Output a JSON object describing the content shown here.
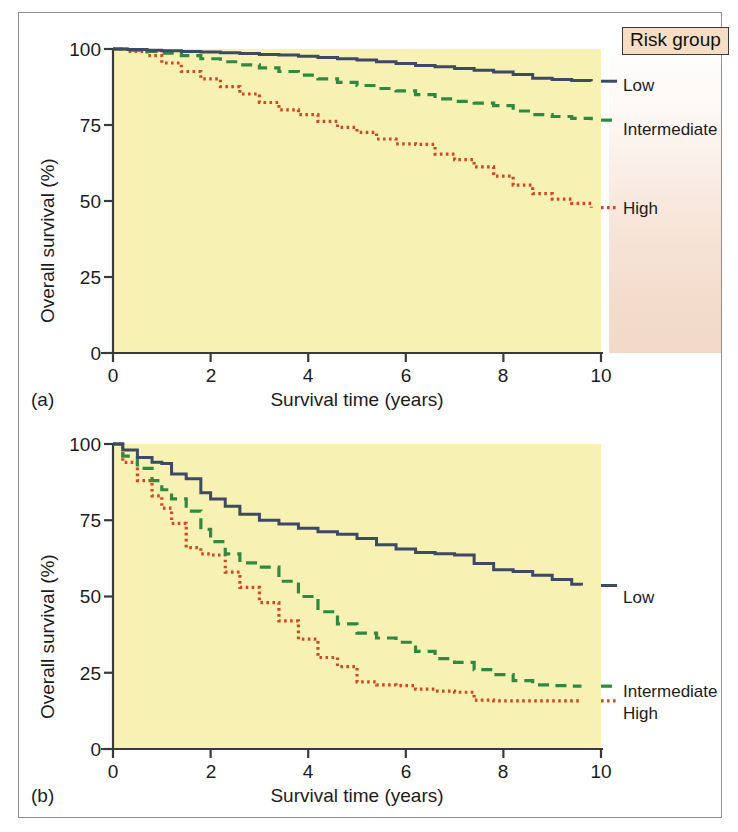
{
  "figure": {
    "panels": [
      {
        "tag": "(a)",
        "axis": {
          "xlabel": "Survival time (years)",
          "ylabel": "Overall survival (%)",
          "xticks": [
            "0",
            "2",
            "4",
            "6",
            "8",
            "10"
          ],
          "yticks": [
            "0",
            "25",
            "50",
            "75",
            "100"
          ]
        }
      },
      {
        "tag": "(b)",
        "axis": {
          "xlabel": "Survival time (years)",
          "ylabel": "Overall survival (%)",
          "xticks": [
            "0",
            "2",
            "4",
            "6",
            "8",
            "10"
          ],
          "yticks": [
            "0",
            "25",
            "50",
            "75",
            "100"
          ]
        }
      }
    ],
    "legend": {
      "title": "Risk group",
      "entries": [
        {
          "label": "Low",
          "color": "#3c4a63",
          "style": "solid"
        },
        {
          "label": "Intermediate",
          "color": "#2f8a40",
          "style": "dashed"
        },
        {
          "label": "High",
          "color": "#cf4a21",
          "style": "dotted"
        }
      ]
    },
    "colors": {
      "plot_background": "#f8f1b4",
      "frame_border": "#8d8d8d",
      "axis": "#3a3a3a",
      "low": "#3c4a63",
      "intermediate": "#2f8a40",
      "high": "#cf4a21",
      "legend_title_background": "#f6ddc4"
    }
  },
  "chart_data": [
    {
      "type": "line",
      "title": "",
      "panel": "(a)",
      "xlabel": "Survival time (years)",
      "ylabel": "Overall survival (%)",
      "xlim": [
        0,
        10
      ],
      "ylim": [
        0,
        100
      ],
      "xticks": [
        0,
        2,
        4,
        6,
        8,
        10
      ],
      "yticks": [
        0,
        25,
        50,
        75,
        100
      ],
      "grid": false,
      "legend_position": "right-outside",
      "series": [
        {
          "name": "Low",
          "style": "solid",
          "color": "#3c4a63",
          "x": [
            0,
            0.3,
            0.7,
            1.0,
            1.4,
            1.8,
            2.2,
            2.6,
            3.0,
            3.4,
            3.8,
            4.2,
            4.6,
            5.0,
            5.4,
            5.8,
            6.2,
            6.6,
            7.0,
            7.4,
            7.8,
            8.2,
            8.6,
            9.0,
            9.4,
            9.8
          ],
          "y": [
            100,
            99.8,
            99.6,
            99.4,
            99.2,
            99.0,
            98.8,
            98.5,
            98.2,
            98.0,
            97.6,
            97.2,
            96.8,
            96.4,
            95.8,
            95.2,
            94.6,
            94.2,
            93.6,
            93.0,
            92.4,
            91.6,
            90.4,
            90.0,
            89.6,
            89.4
          ]
        },
        {
          "name": "Intermediate",
          "style": "dashed",
          "color": "#2f8a40",
          "x": [
            0,
            0.3,
            0.7,
            1.0,
            1.4,
            1.8,
            2.2,
            2.6,
            3.0,
            3.4,
            3.8,
            4.2,
            4.6,
            5.0,
            5.4,
            5.8,
            6.2,
            6.6,
            7.0,
            7.4,
            7.8,
            8.2,
            8.6,
            9.0,
            9.4,
            9.8
          ],
          "y": [
            100,
            99.6,
            99.2,
            98.6,
            97.8,
            96.8,
            95.8,
            94.8,
            93.8,
            92.6,
            91.4,
            90.2,
            89.0,
            88.0,
            87.0,
            86.2,
            85.0,
            83.6,
            82.8,
            82.2,
            81.4,
            79.6,
            78.4,
            77.8,
            77.2,
            76.6
          ]
        },
        {
          "name": "High",
          "style": "dotted",
          "color": "#cf4a21",
          "x": [
            0,
            0.3,
            0.7,
            1.0,
            1.4,
            1.8,
            2.2,
            2.6,
            3.0,
            3.4,
            3.8,
            4.2,
            4.6,
            5.0,
            5.4,
            5.8,
            6.2,
            6.6,
            7.0,
            7.4,
            7.8,
            8.2,
            8.6,
            9.0,
            9.4,
            9.8
          ],
          "y": [
            100,
            99.2,
            97.8,
            95.4,
            92.6,
            90.2,
            87.6,
            85.2,
            82.4,
            80.0,
            78.4,
            76.2,
            74.2,
            72.6,
            70.4,
            68.8,
            68.6,
            65.4,
            63.6,
            61.2,
            58.2,
            55.2,
            52.4,
            50.6,
            49.2,
            47.8
          ]
        }
      ]
    },
    {
      "type": "line",
      "title": "",
      "panel": "(b)",
      "xlabel": "Survival time (years)",
      "ylabel": "Overall survival (%)",
      "xlim": [
        0,
        10
      ],
      "ylim": [
        0,
        100
      ],
      "xticks": [
        0,
        2,
        4,
        6,
        8,
        10
      ],
      "yticks": [
        0,
        25,
        50,
        75,
        100
      ],
      "grid": false,
      "legend_position": "right-outside",
      "series": [
        {
          "name": "Low",
          "style": "solid",
          "color": "#3c4a63",
          "x": [
            0,
            0.2,
            0.5,
            0.8,
            1.0,
            1.2,
            1.5,
            1.8,
            2.0,
            2.3,
            2.6,
            3.0,
            3.4,
            3.8,
            4.2,
            4.6,
            5.0,
            5.4,
            5.8,
            6.2,
            6.6,
            7.0,
            7.4,
            7.8,
            8.2,
            8.6,
            9.0,
            9.4,
            9.6
          ],
          "y": [
            100,
            98.0,
            95.6,
            94.0,
            93.6,
            90.2,
            88.6,
            84.0,
            82.0,
            79.6,
            77.0,
            75.0,
            73.8,
            72.4,
            71.2,
            70.4,
            69.0,
            67.0,
            65.6,
            64.4,
            64.0,
            63.6,
            60.8,
            58.8,
            58.2,
            57.0,
            55.6,
            54.0,
            53.6
          ]
        },
        {
          "name": "Intermediate",
          "style": "dashed",
          "color": "#2f8a40",
          "x": [
            0,
            0.2,
            0.5,
            0.8,
            1.0,
            1.2,
            1.5,
            1.8,
            2.0,
            2.3,
            2.6,
            3.0,
            3.4,
            3.8,
            4.2,
            4.6,
            5.0,
            5.4,
            5.8,
            6.2,
            6.6,
            7.0,
            7.4,
            7.8,
            8.2,
            8.6,
            9.0,
            9.4,
            9.6
          ],
          "y": [
            100,
            96.0,
            92.0,
            88.0,
            85.0,
            82.0,
            78.0,
            72.0,
            68.0,
            64.0,
            61.0,
            59.6,
            55.0,
            50.0,
            45.0,
            41.0,
            38.0,
            36.4,
            35.0,
            32.0,
            29.6,
            28.4,
            26.0,
            24.4,
            22.4,
            21.0,
            20.8,
            20.6,
            20.6
          ]
        },
        {
          "name": "High",
          "style": "dotted",
          "color": "#cf4a21",
          "x": [
            0,
            0.2,
            0.5,
            0.8,
            1.0,
            1.2,
            1.5,
            1.8,
            2.0,
            2.3,
            2.6,
            3.0,
            3.4,
            3.8,
            4.2,
            4.6,
            5.0,
            5.4,
            5.8,
            6.2,
            6.6,
            7.0,
            7.4,
            7.8,
            8.2,
            8.6,
            9.0,
            9.4,
            9.6
          ],
          "y": [
            100,
            94.0,
            88.0,
            83.0,
            79.0,
            74.0,
            66.0,
            64.0,
            63.6,
            58.0,
            53.0,
            48.0,
            42.0,
            36.0,
            30.0,
            27.0,
            22.0,
            21.0,
            20.8,
            19.6,
            19.0,
            18.6,
            16.0,
            15.8,
            15.8,
            15.8,
            15.8,
            15.8,
            15.8
          ]
        }
      ]
    }
  ]
}
